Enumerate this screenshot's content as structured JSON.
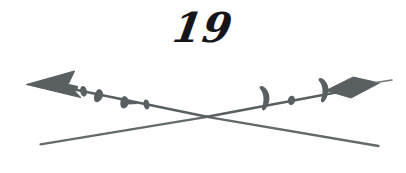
{
  "page": {
    "width": 406,
    "height": 173,
    "background_color": "#ffffff",
    "kind": "book-page-ornament"
  },
  "page_number": {
    "label": "19",
    "color": "#16161a",
    "style": "italic-calligraphic-serif",
    "position": "top-center"
  },
  "ornament": {
    "name": "crossed-arrows-divider",
    "ink_color": "#5a5f61",
    "ink_color_light": "#6d7274",
    "stroke_width": 2.2,
    "crossing_point": {
      "x": 207,
      "y": 117
    },
    "arrow_upper": {
      "name": "left-pointing-barbed-arrow",
      "tip": {
        "x": 27,
        "y": 84
      },
      "tail": {
        "x": 379,
        "y": 88
      },
      "head_shape": "barbed-triangle",
      "tail_shape": "diamond",
      "fletching_left_count": 4,
      "fletching_right_count": 2,
      "node_count": 1
    },
    "arrow_lower": {
      "name": "plain-crossing-line",
      "start": {
        "x": 40,
        "y": 144
      },
      "end": {
        "x": 379,
        "y": 146
      },
      "head_shape": "none",
      "tail_shape": "none"
    }
  }
}
